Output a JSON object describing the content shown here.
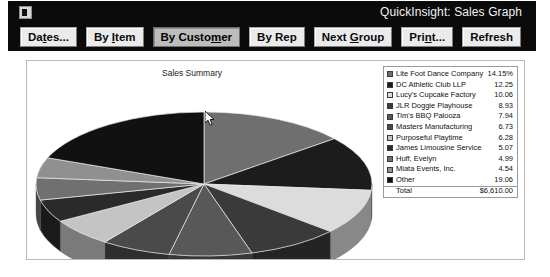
{
  "window": {
    "title": "QuickInsight: Sales Graph",
    "system_icon": "window-icon"
  },
  "toolbar": {
    "buttons": [
      {
        "label": "Dates...",
        "active": false
      },
      {
        "label": "By Item",
        "active": false
      },
      {
        "label": "By Customer",
        "active": true
      },
      {
        "label": "By Rep",
        "active": false
      },
      {
        "label": "Next Group",
        "active": false
      },
      {
        "label": "Print...",
        "active": false
      },
      {
        "label": "Refresh",
        "active": false
      }
    ]
  },
  "legend": {
    "total_label": "Total",
    "total_value": "$6,610.00"
  },
  "chart_data": {
    "type": "pie",
    "title": "Sales Summary",
    "xlabel": "",
    "ylabel": "",
    "value_unit": "percent",
    "total_label": "Total",
    "total_value": "$6,610.00",
    "categories": [
      "Lite Foot Dance Company",
      "DC Athletic Club LLP",
      "Lucy's Cupcake Factory",
      "JLR Doggie Playhouse",
      "Tim's BBQ Palooza",
      "Masters Manufacturing",
      "Purposeful Playtime",
      "James Limousine Service",
      "Huff, Evelyn",
      "Miata Events, Inc.",
      "Other"
    ],
    "values": [
      14.15,
      12.25,
      10.06,
      8.93,
      7.94,
      6.73,
      6.28,
      5.07,
      4.99,
      4.54,
      19.06
    ],
    "value_labels": [
      "14.15%",
      "12.25",
      "10.06",
      "8.93",
      "7.94",
      "6.73",
      "6.28",
      "5.07",
      "4.99",
      "4.54",
      "19.06"
    ],
    "colors": [
      "#6f6f6f",
      "#1c1c1c",
      "#dcdcdc",
      "#3a3a3a",
      "#585858",
      "#4a4a4a",
      "#c4c4c4",
      "#2a2a2a",
      "#707070",
      "#909090",
      "#111111"
    ],
    "legend_position": "right",
    "grid": false
  }
}
